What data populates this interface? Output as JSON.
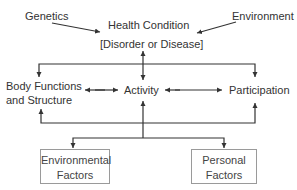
{
  "diagram": {
    "nodes": {
      "genetics": "Genetics",
      "environment": "Environment",
      "health_condition_line1": "Health Condition",
      "health_condition_line2": "[Disorder or Disease]",
      "body_functions_line1": "Body Functions",
      "body_functions_line2": "and Structure",
      "activity": "Activity",
      "participation": "Participation",
      "environmental_factors_line1": "Environmental",
      "environmental_factors_line2": "Factors",
      "personal_factors_line1": "Personal",
      "personal_factors_line2": "Factors"
    },
    "edges": [
      {
        "from": "Genetics",
        "to": "Health Condition",
        "type": "arrow"
      },
      {
        "from": "Environment",
        "to": "Health Condition",
        "type": "arrow"
      },
      {
        "from": "Health Condition",
        "to": "Activity",
        "type": "bidirectional"
      },
      {
        "from": "Body Functions and Structure",
        "to": "Activity",
        "type": "bidirectional"
      },
      {
        "from": "Activity",
        "to": "Participation",
        "type": "bidirectional"
      },
      {
        "from": "Health Condition",
        "to": "Body Functions and Structure",
        "type": "arrow"
      },
      {
        "from": "Health Condition",
        "to": "Participation",
        "type": "arrow"
      },
      {
        "from": "Contextual Factors",
        "to": "Body Functions and Structure",
        "type": "arrow"
      },
      {
        "from": "Contextual Factors",
        "to": "Activity",
        "type": "arrow"
      },
      {
        "from": "Contextual Factors",
        "to": "Participation",
        "type": "arrow"
      },
      {
        "from": "Activity",
        "to": "Environmental Factors",
        "type": "arrow"
      },
      {
        "from": "Activity",
        "to": "Personal Factors",
        "type": "arrow"
      }
    ],
    "colors": {
      "line": "#333333",
      "text": "#333333",
      "box_border": "#9a9a9a"
    }
  }
}
